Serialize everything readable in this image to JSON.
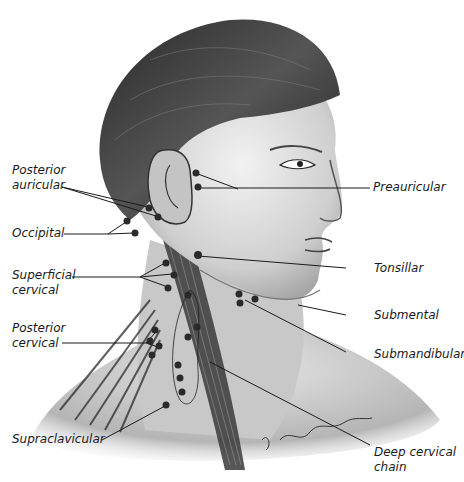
{
  "figure": {
    "signature": "S. Shapiro Bowman"
  },
  "labels_left": [
    {
      "id": "posterior-auricular",
      "lines": [
        "Posterior",
        "auricular"
      ]
    },
    {
      "id": "occipital",
      "lines": [
        "Occipital"
      ]
    },
    {
      "id": "superficial-cervical",
      "lines": [
        "Superficial",
        "cervical"
      ]
    },
    {
      "id": "posterior-cervical",
      "lines": [
        "Posterior",
        "cervical"
      ]
    },
    {
      "id": "supraclavicular",
      "lines": [
        "Supraclavicular"
      ]
    }
  ],
  "labels_right": [
    {
      "id": "preauricular",
      "lines": [
        "Preauricular"
      ]
    },
    {
      "id": "tonsillar",
      "lines": [
        "Tonsillar"
      ]
    },
    {
      "id": "submental",
      "lines": [
        "Submental"
      ]
    },
    {
      "id": "submandibular",
      "lines": [
        "Submandibular"
      ]
    },
    {
      "id": "deep-cervical-chain",
      "lines": [
        "Deep cervical",
        "chain"
      ]
    }
  ],
  "colors": {
    "ink": "#1a1a1a",
    "node": "#2a2a2a",
    "skin": "#d9d9d9",
    "hair": "#3a3a3a"
  }
}
